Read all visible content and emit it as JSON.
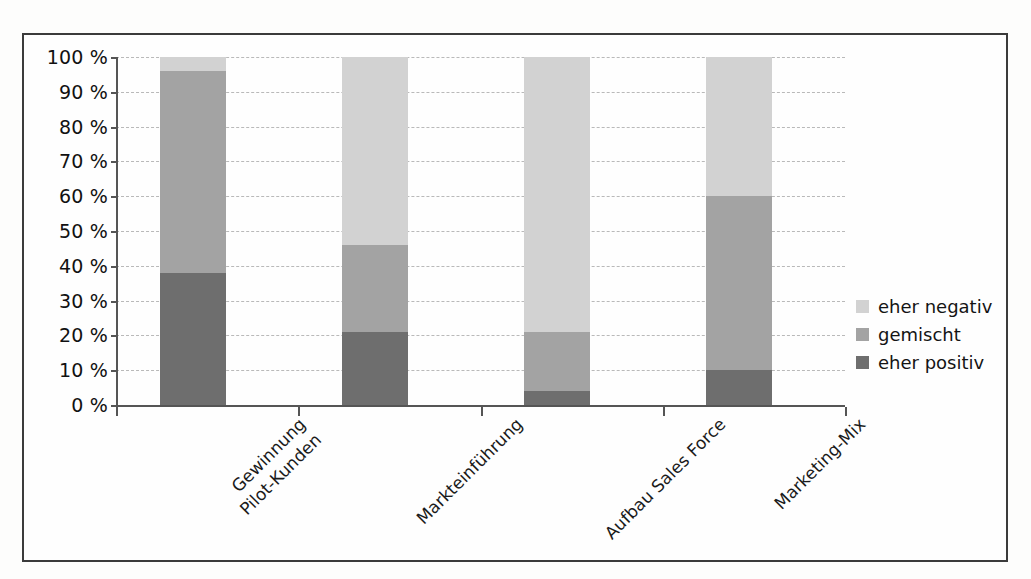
{
  "chart_data": {
    "type": "bar",
    "subtype": "stacked-100-percent",
    "title": "",
    "xlabel": "",
    "ylabel": "",
    "ylim": [
      0,
      100
    ],
    "yunit": "%",
    "grid": true,
    "legend_position": "right",
    "categories": [
      "Gewinnung Pilot-Kunden",
      "Markteinführung",
      "Aufbau Sales Force",
      "Marketing-Mix"
    ],
    "category_label_lines": [
      [
        "Gewinnung",
        "Pilot-Kunden"
      ],
      [
        "Markteinführung"
      ],
      [
        "Aufbau Sales Force"
      ],
      [
        "Marketing-Mix"
      ]
    ],
    "series": [
      {
        "name": "eher positiv",
        "color": "#6e6e6e",
        "values": [
          38,
          21,
          4,
          10
        ]
      },
      {
        "name": "gemischt",
        "color": "#a3a3a3",
        "values": [
          58,
          25,
          17,
          50
        ]
      },
      {
        "name": "eher negativ",
        "color": "#d2d2d2",
        "values": [
          4,
          54,
          79,
          40
        ]
      }
    ],
    "cumulative_tops": {
      "eher positiv": [
        38,
        21,
        4,
        10
      ],
      "gemischt": [
        96,
        46,
        21,
        60
      ],
      "eher negativ": [
        100,
        100,
        100,
        100
      ]
    },
    "ticks": [
      {
        "value": 100,
        "label": "100 %"
      },
      {
        "value": 90,
        "label": "90 %"
      },
      {
        "value": 80,
        "label": "80 %"
      },
      {
        "value": 70,
        "label": "70 %"
      },
      {
        "value": 60,
        "label": "60 %"
      },
      {
        "value": 50,
        "label": "50 %"
      },
      {
        "value": 40,
        "label": "40 %"
      },
      {
        "value": 30,
        "label": "30 %"
      },
      {
        "value": 20,
        "label": "20 %"
      },
      {
        "value": 10,
        "label": "10 %"
      },
      {
        "value": 0,
        "label": "0 %"
      }
    ]
  },
  "legend": {
    "items": [
      {
        "label": "eher negativ",
        "color": "#d2d2d2"
      },
      {
        "label": "gemischt",
        "color": "#a3a3a3"
      },
      {
        "label": "eher positiv",
        "color": "#6e6e6e"
      }
    ]
  }
}
